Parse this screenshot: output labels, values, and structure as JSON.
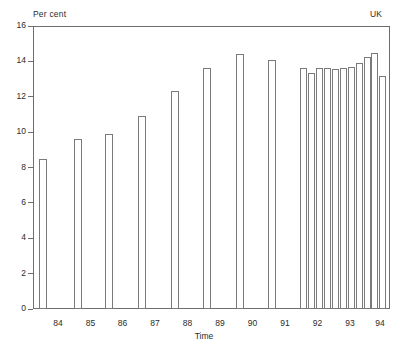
{
  "labels": {
    "y_axis_title": "Per cent",
    "region": "UK",
    "x_axis_title": "Time"
  },
  "colors": {
    "axis": "#6e6e6e",
    "bar_outline": "#7a7a7a",
    "bar_fill": "#ffffff",
    "text": "#2b2b2b",
    "background": "#ffffff"
  },
  "chart_data": {
    "type": "bar",
    "title": "",
    "subtitle": "",
    "xlabel": "Time",
    "ylabel": "Per cent",
    "annotation": "UK",
    "ylim": [
      0,
      16
    ],
    "ytick_values": [
      0,
      2,
      4,
      6,
      8,
      10,
      12,
      14,
      16
    ],
    "ytick_labels": [
      "0",
      "2",
      "4",
      "6",
      "8",
      "10",
      "12",
      "14",
      "16"
    ],
    "xtick_labels": [
      "84",
      "85",
      "86",
      "87",
      "88",
      "89",
      "90",
      "91",
      "92",
      "93",
      "94"
    ],
    "grid": false,
    "legend": "none",
    "categories": [
      "84-a",
      "85-a",
      "86-a",
      "87-a",
      "88-a",
      "89-a",
      "90-a",
      "91-a",
      "92Q1",
      "92Q2",
      "92Q3",
      "92Q4",
      "93Q1",
      "93Q2",
      "93Q3",
      "93Q4",
      "94Q1",
      "94Q2",
      "94Q3"
    ],
    "values": [
      8.5,
      9.6,
      9.9,
      10.9,
      12.3,
      13.65,
      14.4,
      14.1,
      13.6,
      13.35,
      13.6,
      13.65,
      13.55,
      13.6,
      13.7,
      13.9,
      14.25,
      14.5,
      13.2
    ],
    "bars": [
      {
        "name": "bar-84",
        "value": 8.5,
        "x_px": 39.0,
        "width_px": 8.0
      },
      {
        "name": "bar-85",
        "value": 9.6,
        "x_px": 73.5,
        "width_px": 8.0
      },
      {
        "name": "bar-86",
        "value": 9.9,
        "x_px": 105.0,
        "width_px": 8.0
      },
      {
        "name": "bar-87",
        "value": 10.9,
        "x_px": 138.0,
        "width_px": 8.0
      },
      {
        "name": "bar-88",
        "value": 12.3,
        "x_px": 170.5,
        "width_px": 8.0
      },
      {
        "name": "bar-89",
        "value": 13.65,
        "x_px": 203.0,
        "width_px": 8.0
      },
      {
        "name": "bar-90",
        "value": 14.4,
        "x_px": 235.5,
        "width_px": 8.0
      },
      {
        "name": "bar-91",
        "value": 14.1,
        "x_px": 268.0,
        "width_px": 8.0
      },
      {
        "name": "bar-92q1",
        "value": 13.6,
        "x_px": 300.0,
        "width_px": 7.0
      },
      {
        "name": "bar-92q2",
        "value": 13.35,
        "x_px": 308.0,
        "width_px": 7.0
      },
      {
        "name": "bar-92q3",
        "value": 13.6,
        "x_px": 316.0,
        "width_px": 7.0
      },
      {
        "name": "bar-92q4",
        "value": 13.65,
        "x_px": 324.0,
        "width_px": 7.0
      },
      {
        "name": "bar-93q1",
        "value": 13.55,
        "x_px": 332.0,
        "width_px": 7.0
      },
      {
        "name": "bar-93q2",
        "value": 13.6,
        "x_px": 340.0,
        "width_px": 7.0
      },
      {
        "name": "bar-93q3",
        "value": 13.7,
        "x_px": 348.0,
        "width_px": 7.0
      },
      {
        "name": "bar-93q4",
        "value": 13.9,
        "x_px": 356.0,
        "width_px": 7.0
      },
      {
        "name": "bar-94q1",
        "value": 14.25,
        "x_px": 363.5,
        "width_px": 7.0
      },
      {
        "name": "bar-94q2",
        "value": 14.5,
        "x_px": 371.0,
        "width_px": 7.0
      },
      {
        "name": "bar-94q3",
        "value": 13.2,
        "x_px": 378.5,
        "width_px": 7.0
      }
    ],
    "xticks": [
      {
        "label": "84",
        "x_px": 58.0
      },
      {
        "label": "85",
        "x_px": 90.5
      },
      {
        "label": "86",
        "x_px": 122.5
      },
      {
        "label": "87",
        "x_px": 155.0
      },
      {
        "label": "88",
        "x_px": 187.5
      },
      {
        "label": "89",
        "x_px": 220.0
      },
      {
        "label": "90",
        "x_px": 252.5
      },
      {
        "label": "91",
        "x_px": 285.0
      },
      {
        "label": "92",
        "x_px": 317.5
      },
      {
        "label": "93",
        "x_px": 350.0
      },
      {
        "label": "94",
        "x_px": 380.0
      }
    ]
  },
  "geometry": {
    "plot_left_px": 33,
    "plot_right_px": 390,
    "plot_top_px": 26,
    "plot_bottom_px": 309
  }
}
